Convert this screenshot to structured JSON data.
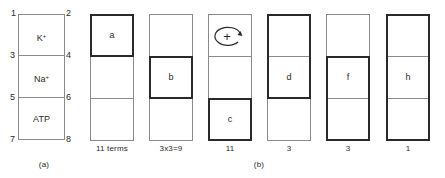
{
  "panel_a": {
    "caption": "(a)",
    "corner_numbers": [
      "1",
      "2",
      "3",
      "4",
      "5",
      "6",
      "7",
      "8"
    ],
    "cells": [
      {
        "ion": "K",
        "charge": "+"
      },
      {
        "ion": "Na",
        "charge": "+"
      },
      {
        "ion": "ATP",
        "charge": ""
      }
    ]
  },
  "panel_b": {
    "caption": "(b)",
    "columns": [
      {
        "label": "a",
        "count": "11 terms",
        "bold_rows": [
          0,
          0
        ],
        "label_row": 0
      },
      {
        "label": "b",
        "count": "3x3=9",
        "bold_rows": [
          1,
          1
        ],
        "label_row": 1
      },
      {
        "label": "c",
        "count": "11",
        "bold_rows": [
          2,
          2
        ],
        "label_row": 2,
        "symbol": "+",
        "symbol_row": 0
      },
      {
        "label": "d",
        "count": "3",
        "bold_rows": [
          0,
          1
        ],
        "label_row": 1
      },
      {
        "label": "f",
        "count": "3",
        "bold_rows": [
          1,
          2
        ],
        "label_row": 1
      },
      {
        "label": "h",
        "count": "1",
        "bold_rows": [
          0,
          2
        ],
        "label_row": 1
      }
    ]
  },
  "colors": {
    "thin_line": "#8a8a8a",
    "bold_line": "#2a2a2a",
    "text": "#2a2a2a"
  }
}
